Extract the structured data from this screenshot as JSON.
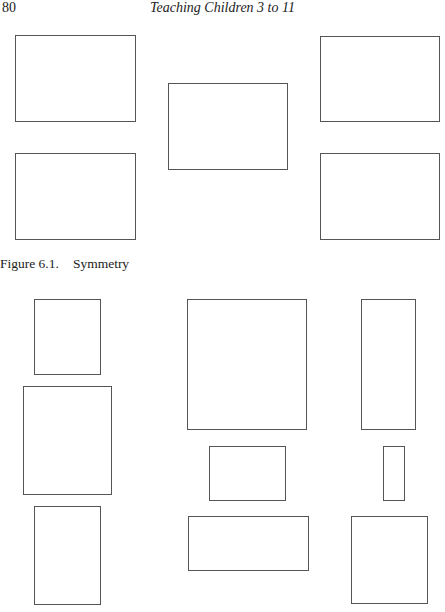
{
  "header": {
    "page_number": "80",
    "running_title": "Teaching Children 3 to 11"
  },
  "figure": {
    "number": "Figure 6.1.",
    "title": "Symmetry"
  },
  "shapes_top": [
    {
      "x": 15,
      "y": 35,
      "w": 121,
      "h": 87
    },
    {
      "x": 15,
      "y": 153,
      "w": 121,
      "h": 87
    },
    {
      "x": 168,
      "y": 83,
      "w": 120,
      "h": 87
    },
    {
      "x": 320,
      "y": 36,
      "w": 120,
      "h": 86
    },
    {
      "x": 320,
      "y": 153,
      "w": 120,
      "h": 87
    }
  ],
  "shapes_bottom": [
    {
      "x": 34,
      "y": 299,
      "w": 67,
      "h": 76
    },
    {
      "x": 23,
      "y": 386,
      "w": 89,
      "h": 109
    },
    {
      "x": 34,
      "y": 506,
      "w": 67,
      "h": 99
    },
    {
      "x": 187,
      "y": 299,
      "w": 120,
      "h": 131
    },
    {
      "x": 209,
      "y": 446,
      "w": 77,
      "h": 55
    },
    {
      "x": 188,
      "y": 516,
      "w": 121,
      "h": 55
    },
    {
      "x": 361,
      "y": 299,
      "w": 55,
      "h": 131
    },
    {
      "x": 383,
      "y": 446,
      "w": 22,
      "h": 55
    },
    {
      "x": 351,
      "y": 516,
      "w": 77,
      "h": 88
    }
  ]
}
